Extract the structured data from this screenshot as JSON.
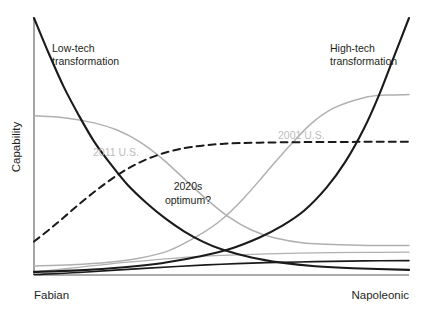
{
  "chart_data": {
    "type": "line",
    "title": "",
    "subtitle": "",
    "xlabel": "",
    "ylabel": "Capability",
    "xlim": [
      0,
      1
    ],
    "ylim": [
      0,
      1
    ],
    "grid": false,
    "legend_position": "inline-annotations",
    "x_tick_labels": [
      "Fabian",
      "Napoleonic"
    ],
    "x_axis_left_label": "Fabian",
    "x_axis_right_label": "Napoleonic",
    "annotations": [
      {
        "id": "low-tech",
        "text": "Low-tech\ntransformation",
        "line1": "Low-tech",
        "line2": "transformation",
        "x": 0.13,
        "y": 0.82,
        "color": "#231f20"
      },
      {
        "id": "high-tech",
        "text": "High-tech\ntransformation",
        "line1": "High-tech",
        "line2": "transformation",
        "x": 0.84,
        "y": 0.82,
        "color": "#231f20"
      },
      {
        "id": "2011-us",
        "text": "2011 U.S.",
        "line1": "2011 U.S.",
        "line2": "",
        "x": 0.28,
        "y": 0.54,
        "color": "#bdbdbd"
      },
      {
        "id": "2001-us",
        "text": "2001 U.S.",
        "line1": "2001 U.S.",
        "line2": "",
        "x": 0.73,
        "y": 0.58,
        "color": "#bdbdbd"
      },
      {
        "id": "2020s-optimum",
        "text": "2020s\noptimum?",
        "line1": "2020s",
        "line2": "optimum?",
        "x": 0.5,
        "y": 0.38,
        "color": "#231f20"
      }
    ],
    "series": [
      {
        "name": "Low-tech transformation",
        "style": "solid",
        "color": "#1a1a1a",
        "width": 2.1,
        "description": "Steep exponential decay from very high capability at Fabian end down to near zero toward Napoleonic end",
        "x": [
          0.0,
          0.04,
          0.08,
          0.12,
          0.16,
          0.2,
          0.25,
          0.3,
          0.35,
          0.4,
          0.45,
          0.5,
          0.58,
          0.66,
          0.75,
          0.85,
          1.0
        ],
        "y": [
          1.0,
          0.86,
          0.73,
          0.62,
          0.52,
          0.44,
          0.35,
          0.28,
          0.22,
          0.17,
          0.13,
          0.1,
          0.068,
          0.048,
          0.034,
          0.026,
          0.02
        ]
      },
      {
        "name": "High-tech transformation",
        "style": "solid",
        "color": "#1a1a1a",
        "width": 2.1,
        "description": "Steep exponential growth from near zero at Fabian end up to maximum at Napoleonic end",
        "x": [
          0.0,
          0.12,
          0.24,
          0.34,
          0.44,
          0.52,
          0.6,
          0.66,
          0.72,
          0.78,
          0.83,
          0.88,
          0.92,
          0.96,
          1.0
        ],
        "y": [
          0.012,
          0.018,
          0.03,
          0.046,
          0.072,
          0.1,
          0.145,
          0.19,
          0.25,
          0.34,
          0.44,
          0.57,
          0.7,
          0.85,
          1.0
        ]
      },
      {
        "name": "2011 U.S.",
        "style": "solid",
        "color": "#b0b0b0",
        "width": 1.5,
        "description": "Gray reverse-sigmoid: moderately high at Fabian end, declining through the middle to a low plateau at Napoleonic end",
        "x": [
          0.0,
          0.08,
          0.16,
          0.22,
          0.28,
          0.34,
          0.4,
          0.46,
          0.52,
          0.58,
          0.64,
          0.72,
          0.82,
          0.92,
          1.0
        ],
        "y": [
          0.62,
          0.612,
          0.592,
          0.565,
          0.52,
          0.455,
          0.375,
          0.295,
          0.225,
          0.175,
          0.145,
          0.125,
          0.118,
          0.115,
          0.115
        ]
      },
      {
        "name": "2001 U.S.",
        "style": "solid",
        "color": "#b0b0b0",
        "width": 1.5,
        "description": "Gray sigmoid: very low at Fabian end, rising steeply through the middle-right to a high plateau at Napoleonic end",
        "x": [
          0.0,
          0.1,
          0.2,
          0.28,
          0.36,
          0.44,
          0.5,
          0.56,
          0.62,
          0.68,
          0.74,
          0.8,
          0.88,
          0.94,
          1.0
        ],
        "y": [
          0.035,
          0.04,
          0.05,
          0.065,
          0.095,
          0.155,
          0.215,
          0.3,
          0.4,
          0.5,
          0.59,
          0.65,
          0.69,
          0.7,
          0.702
        ]
      },
      {
        "name": "2020s optimum?",
        "style": "dashed",
        "color": "#1a1a1a",
        "width": 2.0,
        "description": "Dashed concave curve: rises from low-moderate at Fabian end to a flat plateau across the middle and right",
        "x": [
          0.0,
          0.06,
          0.12,
          0.18,
          0.24,
          0.3,
          0.36,
          0.42,
          0.5,
          0.6,
          0.72,
          0.86,
          1.0
        ],
        "y": [
          0.13,
          0.2,
          0.275,
          0.345,
          0.405,
          0.45,
          0.48,
          0.498,
          0.51,
          0.515,
          0.517,
          0.518,
          0.518
        ]
      },
      {
        "name": "low baseline gray",
        "style": "solid",
        "color": "#b0b0b0",
        "width": 1.3,
        "description": "Gray baseline curve rising gently from just above the axis at Fabian end to a low flat level at Napoleonic end",
        "x": [
          0.0,
          0.12,
          0.25,
          0.38,
          0.5,
          0.62,
          0.75,
          0.88,
          1.0
        ],
        "y": [
          0.012,
          0.03,
          0.05,
          0.066,
          0.076,
          0.082,
          0.086,
          0.088,
          0.089
        ]
      },
      {
        "name": "low baseline black",
        "style": "solid",
        "color": "#1a1a1a",
        "width": 1.6,
        "description": "Black baseline curve rising gently from the axis at Fabian end to a low flat level at Napoleonic end",
        "x": [
          0.0,
          0.12,
          0.25,
          0.38,
          0.5,
          0.62,
          0.75,
          0.88,
          1.0
        ],
        "y": [
          0.002,
          0.01,
          0.022,
          0.033,
          0.042,
          0.048,
          0.052,
          0.055,
          0.056
        ]
      }
    ]
  }
}
